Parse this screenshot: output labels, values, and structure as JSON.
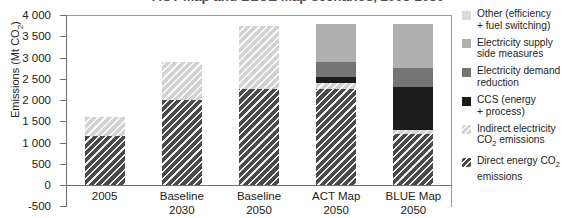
{
  "chart_data": {
    "type": "bar",
    "title": "ACT Map and BLUE Map scenarios, 2005-2050",
    "xlabel": "",
    "ylabel": "Emissions (Mt CO2)",
    "ylabel_html": "Emissions (Mt CO<sub>2</sub>)",
    "ylim": [
      -500,
      4000
    ],
    "ytick_step": 500,
    "grid": false,
    "stacked": true,
    "legend_position": "right",
    "categories": [
      "2005",
      "Baseline 2030",
      "Baseline 2050",
      "ACT Map 2050",
      "BLUE Map 2050"
    ],
    "category_lines": [
      [
        "2005",
        ""
      ],
      [
        "Baseline",
        "2030"
      ],
      [
        "Baseline",
        "2050"
      ],
      [
        "ACT Map",
        "2050"
      ],
      [
        "BLUE Map",
        "2050"
      ]
    ],
    "ytick_labels": [
      "4 000",
      "3 500",
      "3 000",
      "2 500",
      "2 000",
      "1 500",
      "1 000",
      "500",
      "0",
      "-500"
    ],
    "ytick_values": [
      4000,
      3500,
      3000,
      2500,
      2000,
      1500,
      1000,
      500,
      0,
      -500
    ],
    "series": [
      {
        "name": "Direct energy CO2 emissions",
        "key": "direct",
        "color": "#4a4a4a",
        "pattern": "diagonal-hatch",
        "values": [
          1150,
          2000,
          2250,
          2250,
          1200
        ]
      },
      {
        "name": "Indirect electricity CO2 emissions",
        "key": "indirect",
        "color": "#d2d2d2",
        "pattern": "diagonal-hatch",
        "values": [
          450,
          900,
          1500,
          150,
          100
        ]
      },
      {
        "name": "CCS (energy + process)",
        "key": "ccs",
        "color": "#1c1c1c",
        "pattern": "solid",
        "values": [
          0,
          0,
          0,
          150,
          1000
        ]
      },
      {
        "name": "Electricity demand reduction",
        "key": "demand",
        "color": "#757575",
        "pattern": "solid",
        "values": [
          0,
          0,
          0,
          350,
          450
        ]
      },
      {
        "name": "Electricity supply side measures",
        "key": "supply",
        "color": "#b0b0b0",
        "pattern": "solid",
        "values": [
          0,
          0,
          0,
          900,
          1050
        ]
      },
      {
        "name": "Other (efficiency + fuel switching)",
        "key": "other",
        "color": "#d9d9d9",
        "pattern": "solid",
        "values": [
          0,
          0,
          0,
          0,
          0
        ]
      }
    ],
    "totals": [
      1600,
      2900,
      3750,
      3800,
      3800
    ]
  },
  "legend": {
    "items": [
      {
        "swatch": "sw-other",
        "label_line1": "Other (efficiency",
        "label_line2": "+ fuel switching)",
        "sub": ""
      },
      {
        "swatch": "sw-supply",
        "label_line1": "Electricity supply",
        "label_line2": "side measures",
        "sub": ""
      },
      {
        "swatch": "sw-demand",
        "label_line1": "Electricity demand",
        "label_line2": "reduction",
        "sub": ""
      },
      {
        "swatch": "sw-ccs",
        "label_line1": "CCS (energy",
        "label_line2": "+ process)",
        "sub": ""
      },
      {
        "swatch": "sw-indirect",
        "label_line1": "Indirect electricity",
        "label_line2": "CO2 emissions",
        "sub": "2"
      },
      {
        "swatch": "sw-direct",
        "label_line1": "Direct energy CO2",
        "label_line2": "emissions",
        "sub": "2"
      }
    ]
  }
}
